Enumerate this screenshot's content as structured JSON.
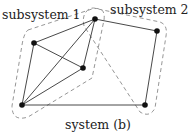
{
  "labels": {
    "subsystem1": "subsystem 1",
    "subsystem2": "subsystem 2",
    "caption": "system (b)"
  },
  "nodes": [
    {
      "id": "top",
      "x": 95,
      "y": 19
    },
    {
      "id": "left",
      "x": 34,
      "y": 43
    },
    {
      "id": "middle",
      "x": 83,
      "y": 68
    },
    {
      "id": "bottom-left",
      "x": 22,
      "y": 105
    },
    {
      "id": "right-top",
      "x": 157,
      "y": 31
    },
    {
      "id": "bottom-right",
      "x": 145,
      "y": 105
    }
  ],
  "edges": [
    [
      "top",
      "left"
    ],
    [
      "top",
      "bottom-left"
    ],
    [
      "top",
      "middle"
    ],
    [
      "left",
      "middle"
    ],
    [
      "left",
      "bottom-left"
    ],
    [
      "middle",
      "bottom-left"
    ],
    [
      "top",
      "right-top"
    ],
    [
      "right-top",
      "bottom-right"
    ],
    [
      "bottom-left",
      "bottom-right"
    ]
  ],
  "colors": {
    "edge": "#333333",
    "hull": "#8a8a8a",
    "node": "#111111"
  }
}
